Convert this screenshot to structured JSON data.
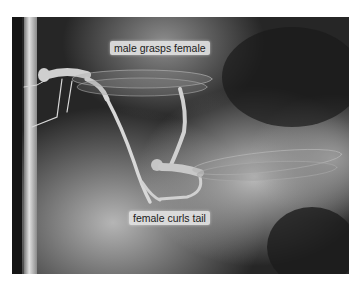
{
  "figure": {
    "annotations": [
      {
        "id": "male",
        "text": "male grasps female"
      },
      {
        "id": "female",
        "text": "female curls tail"
      }
    ]
  },
  "colors": {
    "background_dark": "#1e1e1e",
    "background_light": "#a8a8a8",
    "stem": "#cfcfcf",
    "label_bg": "#e1e1e1",
    "label_text": "#1a1a1a"
  }
}
